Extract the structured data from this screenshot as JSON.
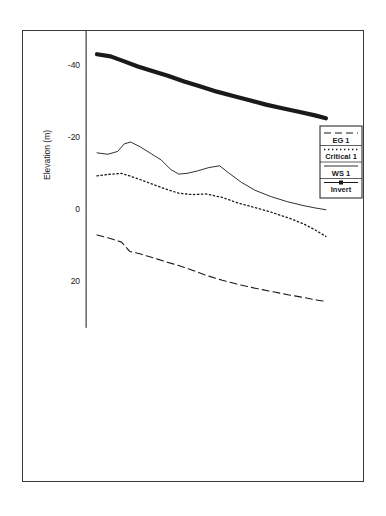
{
  "chart_data": {
    "type": "line",
    "title": "",
    "xlabel": "Main Channel Distance (m)",
    "ylabel": "Elevation (m)",
    "xlim": [
      -20,
      430
    ],
    "ylim": [
      -63,
      33
    ],
    "xticks": [
      0,
      100,
      200,
      300,
      400
    ],
    "yticks": [
      20,
      0,
      -20,
      -40,
      -60
    ],
    "xtick_labels": [
      "0",
      "100",
      "200",
      "300",
      "400"
    ],
    "ytick_labels": [
      "20",
      "0",
      "-20",
      "-40",
      "-60"
    ],
    "x_minor_interval": 20,
    "y_minor_interval": 5,
    "grid": false,
    "legend_position": "upper right",
    "series": [
      {
        "name": "EG 1",
        "style": "dashed",
        "x": [
          0,
          20,
          45,
          60,
          75,
          100,
          125,
          150,
          175,
          200,
          230,
          260,
          290,
          320,
          350,
          380,
          400,
          420
        ],
        "y": [
          7.2,
          8.0,
          9.2,
          11.8,
          12.3,
          13.4,
          14.6,
          15.7,
          17.0,
          18.4,
          19.8,
          21.0,
          22.0,
          22.9,
          23.8,
          24.6,
          25.2,
          25.7
        ]
      },
      {
        "name": "Critical 1",
        "style": "dotted",
        "x": [
          0,
          20,
          45,
          60,
          75,
          100,
          125,
          150,
          175,
          200,
          230,
          260,
          290,
          320,
          350,
          380,
          400,
          420
        ],
        "y": [
          -9.2,
          -9.6,
          -9.9,
          -9.2,
          -8.4,
          -7.0,
          -5.6,
          -4.4,
          -4.0,
          -4.2,
          -3.2,
          -1.6,
          -0.4,
          0.9,
          2.4,
          4.2,
          5.8,
          7.6
        ]
      },
      {
        "name": "WS 1",
        "style": "solid",
        "x": [
          0,
          20,
          38,
          50,
          62,
          80,
          100,
          118,
          135,
          150,
          165,
          185,
          205,
          225,
          240,
          265,
          290,
          320,
          350,
          380,
          400,
          420
        ],
        "y": [
          -15.6,
          -15.2,
          -16.0,
          -18.1,
          -18.6,
          -17.2,
          -15.3,
          -13.6,
          -11.0,
          -9.7,
          -9.9,
          -10.6,
          -11.5,
          -12.0,
          -10.2,
          -7.4,
          -5.2,
          -3.4,
          -2.0,
          -0.9,
          -0.3,
          0.2
        ]
      },
      {
        "name": "Invert",
        "style": "thick",
        "x": [
          0,
          25,
          50,
          75,
          100,
          130,
          160,
          190,
          220,
          250,
          280,
          310,
          340,
          370,
          400,
          420
        ],
        "y": [
          -43.0,
          -42.4,
          -41.0,
          -39.6,
          -38.4,
          -37.0,
          -35.4,
          -34.0,
          -32.6,
          -31.4,
          -30.2,
          -29.0,
          -28.0,
          -27.0,
          -26.0,
          -25.2
        ]
      }
    ],
    "legend_entries": [
      {
        "label": "EG 1",
        "style": "dashed"
      },
      {
        "label": "Critical 1",
        "style": "dotted"
      },
      {
        "label": "WS 1",
        "style": "solid"
      },
      {
        "label": "Invert",
        "style": "thick-marker"
      }
    ]
  },
  "colors": {
    "line": "#1a1a1a",
    "frame": "#3a3a3a",
    "background": "#ffffff"
  }
}
